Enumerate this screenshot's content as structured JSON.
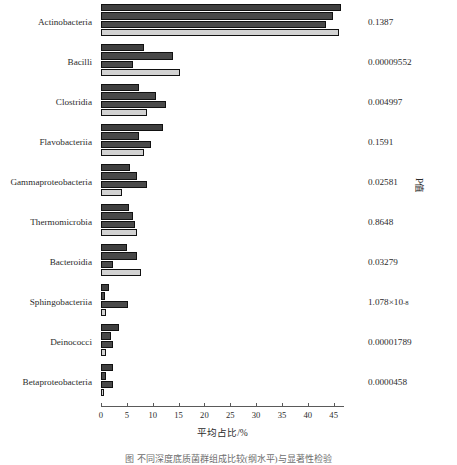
{
  "chart_data": {
    "type": "bar",
    "orientation": "horizontal",
    "title": "",
    "xlabel": "平均占比/%",
    "ylabel": "",
    "right_axis_label": "P值",
    "xlim": [
      0,
      47
    ],
    "xticks": [
      0,
      5,
      10,
      15,
      20,
      25,
      30,
      35,
      40,
      45
    ],
    "xtick_labels": [
      "0",
      "5",
      "10",
      "15",
      "20",
      "25",
      "30",
      "35",
      "40",
      "45"
    ],
    "grid": false,
    "legend": "none",
    "series": [
      {
        "name": "group-1",
        "color": "#3f3f3f",
        "values": [
          46.4,
          8.3,
          7.4,
          11.9,
          5.7,
          5.4,
          5.0,
          1.5,
          3.5,
          2.4
        ]
      },
      {
        "name": "group-2",
        "color": "#484848",
        "values": [
          44.8,
          13.9,
          10.7,
          7.4,
          7.0,
          6.1,
          6.9,
          0.7,
          2.0,
          0.9
        ]
      },
      {
        "name": "group-3",
        "color": "#4a4a4a",
        "values": [
          43.6,
          6.1,
          12.6,
          9.6,
          8.9,
          6.5,
          2.4,
          5.2,
          2.4,
          2.4
        ]
      },
      {
        "name": "group-4",
        "color": "#d2d2d2",
        "values": [
          46.0,
          15.2,
          8.9,
          8.3,
          4.1,
          6.9,
          7.8,
          0.9,
          0.9,
          0.6
        ]
      }
    ],
    "categories": [
      "Actinobacteria",
      "Bacilli",
      "Clostridia",
      "Flavobacteriia",
      "Gammaproteobacteria",
      "Thermomicrobia",
      "Bacteroidia",
      "Sphingobacteriia",
      "Deinococci",
      "Betaproteobacteria"
    ],
    "annotations": {
      "p_values": [
        {
          "text": "0.1387",
          "mantissa": "0.1387",
          "exponent": ""
        },
        {
          "text": "0.00009552",
          "mantissa": "0.00009552",
          "exponent": ""
        },
        {
          "text": "0.004997",
          "mantissa": "0.004997",
          "exponent": ""
        },
        {
          "text": "0.1591",
          "mantissa": "0.1591",
          "exponent": ""
        },
        {
          "text": "0.02581",
          "mantissa": "0.02581",
          "exponent": ""
        },
        {
          "text": "0.8648",
          "mantissa": "0.8648",
          "exponent": ""
        },
        {
          "text": "0.03279",
          "mantissa": "0.03279",
          "exponent": ""
        },
        {
          "text": "1.078×10⁻⁸",
          "mantissa": "1.078×10",
          "exponent": "-8"
        },
        {
          "text": "0.00001789",
          "mantissa": "0.00001789",
          "exponent": ""
        },
        {
          "text": "0.0000458",
          "mantissa": "0.0000458",
          "exponent": ""
        }
      ]
    }
  },
  "caption": "图   不同深度底质菌群组成比较(纲水平)与显著性检验"
}
